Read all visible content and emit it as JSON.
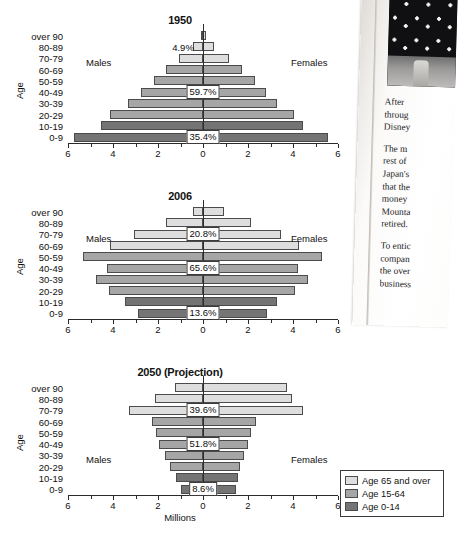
{
  "chart_data": [
    {
      "type": "bar",
      "title": "1950",
      "xlabel": "",
      "ylabel": "Age",
      "xlim": [
        -6,
        6
      ],
      "xticks": [
        "6",
        "4",
        "2",
        "0",
        "2",
        "4",
        "6"
      ],
      "categories": [
        "0-9",
        "10-19",
        "20-29",
        "30-39",
        "40-49",
        "50-59",
        "60-69",
        "70-79",
        "80-89",
        "over 90"
      ],
      "left_label": "Males",
      "right_label": "Females",
      "series": [
        {
          "name": "Males",
          "values": [
            5.75,
            4.55,
            4.15,
            3.35,
            2.75,
            2.2,
            1.65,
            1.05,
            0.45,
            0.1
          ]
        },
        {
          "name": "Females",
          "values": [
            5.55,
            4.45,
            4.05,
            3.3,
            2.8,
            2.3,
            1.75,
            1.15,
            0.5,
            0.12
          ]
        }
      ],
      "group_colors": [
        "c-young",
        "c-young",
        "c-mid",
        "c-mid",
        "c-mid",
        "c-mid",
        "c-mid",
        "c-old",
        "c-old",
        "c-old"
      ],
      "annotations": [
        {
          "text": "35.4%",
          "x": 0,
          "row": 0,
          "boxed": true
        },
        {
          "text": "59.7%",
          "x": 0,
          "row": 4,
          "boxed": true
        },
        {
          "text": "4.9%",
          "x": 0,
          "row": 8,
          "boxed": false
        }
      ]
    },
    {
      "type": "bar",
      "title": "2006",
      "xlabel": "",
      "ylabel": "Age",
      "xlim": [
        -6,
        6
      ],
      "xticks": [
        "6",
        "4",
        "2",
        "0",
        "2",
        "4",
        "6"
      ],
      "categories": [
        "0-9",
        "10-19",
        "20-29",
        "30-39",
        "40-49",
        "50-59",
        "60-69",
        "70-79",
        "80-89",
        "over 90"
      ],
      "left_label": "Males",
      "right_label": "Females",
      "series": [
        {
          "name": "Males",
          "values": [
            2.9,
            3.45,
            4.2,
            4.75,
            4.25,
            5.35,
            4.15,
            3.05,
            1.65,
            0.45
          ]
        },
        {
          "name": "Females",
          "values": [
            2.85,
            3.3,
            4.1,
            4.65,
            4.2,
            5.3,
            4.25,
            3.45,
            2.15,
            0.95
          ]
        }
      ],
      "group_colors": [
        "c-young",
        "c-young",
        "c-mid",
        "c-mid",
        "c-mid",
        "c-mid",
        "c-old",
        "c-old",
        "c-old",
        "c-old"
      ],
      "annotations": [
        {
          "text": "13.6%",
          "x": 0,
          "row": 0,
          "boxed": true
        },
        {
          "text": "65.6%",
          "x": 0,
          "row": 4,
          "boxed": true
        },
        {
          "text": "20.8%",
          "x": 0,
          "row": 7,
          "boxed": true
        }
      ]
    },
    {
      "type": "bar",
      "title": "2050 (Projection)",
      "xlabel": "Millions",
      "ylabel": "Age",
      "xlim": [
        -6,
        6
      ],
      "xticks": [
        "6",
        "4",
        "2",
        "0",
        "2",
        "4",
        "6"
      ],
      "categories": [
        "0-9",
        "10-19",
        "20-29",
        "30-39",
        "40-49",
        "50-59",
        "60-69",
        "70-79",
        "80-89",
        "over 90"
      ],
      "left_label": "Males",
      "right_label": "Females",
      "series": [
        {
          "name": "Males",
          "values": [
            1.0,
            1.2,
            1.45,
            1.7,
            1.95,
            2.1,
            2.25,
            3.3,
            2.15,
            1.25
          ]
        },
        {
          "name": "Females",
          "values": [
            1.45,
            1.55,
            1.65,
            1.8,
            2.0,
            2.15,
            2.35,
            4.45,
            3.95,
            3.75
          ]
        }
      ],
      "group_colors": [
        "c-young",
        "c-young",
        "c-mid",
        "c-mid",
        "c-mid",
        "c-mid",
        "c-mid",
        "c-old",
        "c-old",
        "c-old"
      ],
      "annotations": [
        {
          "text": "8.6%",
          "x": 0,
          "row": 0,
          "boxed": true
        },
        {
          "text": "51.8%",
          "x": 0,
          "row": 4,
          "boxed": true
        },
        {
          "text": "39.6%",
          "x": 0,
          "row": 7,
          "boxed": true
        }
      ]
    }
  ],
  "legend": {
    "items": [
      {
        "label": "Age 65 and over",
        "swatch": "c-old"
      },
      {
        "label": "Age 15-64",
        "swatch": "c-mid"
      },
      {
        "label": "Age 0-14",
        "swatch": "c-young"
      }
    ]
  },
  "magazine": {
    "paragraphs": [
      "After",
      "throug",
      "Disney",
      "The m",
      "rest of",
      "Japan's",
      "that the",
      "money",
      "Mounta",
      "retired.",
      "To entic",
      "compan",
      "the over",
      "business"
    ],
    "photo_alt": "polka-dot-photo"
  }
}
